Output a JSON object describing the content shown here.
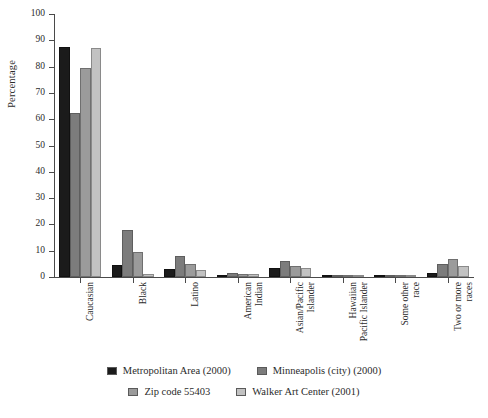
{
  "chart_data": {
    "type": "bar",
    "title": "",
    "xlabel": "",
    "ylabel": "Percentage",
    "ylim": [
      0,
      100
    ],
    "yticks": [
      0,
      10,
      20,
      30,
      40,
      50,
      60,
      70,
      80,
      90,
      100
    ],
    "grid": false,
    "legend_position": "bottom",
    "categories": [
      "Caucasian",
      "Black",
      "Latino",
      "American\nIndian",
      "Asian/Pacific\nIslander",
      "Hawaiian\nPacific Islander",
      "Some other\nrace",
      "Two or more\nraces"
    ],
    "series": [
      {
        "name": "Metropolitan Area (2000)",
        "color": "#1b1b1b",
        "values": [
          87.5,
          4.5,
          3.0,
          0.5,
          3.5,
          0.1,
          0.2,
          1.5
        ]
      },
      {
        "name": "Minneapolis (city) (2000)",
        "color": "#7c7c7c",
        "values": [
          62.5,
          18.0,
          8.0,
          1.5,
          6.0,
          0.1,
          0.2,
          5.0
        ]
      },
      {
        "name": "Zip code 55403",
        "color": "#9b9b9b",
        "values": [
          79.5,
          9.5,
          5.0,
          1.0,
          4.0,
          0.1,
          0.2,
          7.0
        ]
      },
      {
        "name": "Walker Art Center (2001)",
        "color": "#c2c2c2",
        "values": [
          87.0,
          1.0,
          2.5,
          1.0,
          3.5,
          0.1,
          0.2,
          4.0
        ]
      }
    ]
  },
  "legend": {
    "row1": [
      {
        "label": "Metropolitan Area (2000)",
        "color": "#1b1b1b"
      },
      {
        "label": "Minneapolis (city) (2000)",
        "color": "#7c7c7c"
      }
    ],
    "row2": [
      {
        "label": "Zip code 55403",
        "color": "#9b9b9b"
      },
      {
        "label": "Walker Art Center (2001)",
        "color": "#c2c2c2"
      }
    ]
  }
}
